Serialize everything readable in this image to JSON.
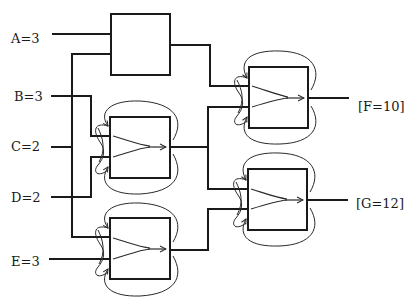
{
  "diagram": {
    "inputs": [
      {
        "id": "A",
        "label": "A=3"
      },
      {
        "id": "B",
        "label": "B=3"
      },
      {
        "id": "C",
        "label": "C=2"
      },
      {
        "id": "D",
        "label": "D=2"
      },
      {
        "id": "E",
        "label": "E=3"
      }
    ],
    "outputs": [
      {
        "id": "F",
        "label": "[F=10]"
      },
      {
        "id": "G",
        "label": "[G=12]"
      }
    ],
    "nodes": [
      {
        "id": "box-top",
        "kind": "plain-box",
        "inputs": [
          "A",
          "C-branch"
        ]
      },
      {
        "id": "box-mid",
        "kind": "merge-box",
        "inputs": [
          "B",
          "D"
        ]
      },
      {
        "id": "box-bottom",
        "kind": "merge-box",
        "inputs": [
          "C-branch",
          "E"
        ]
      },
      {
        "id": "box-right-top",
        "kind": "merge-box",
        "inputs": [
          "box-top",
          "box-mid"
        ],
        "output": "F"
      },
      {
        "id": "box-right-bottom",
        "kind": "merge-box",
        "inputs": [
          "box-mid",
          "box-bottom"
        ],
        "output": "G"
      }
    ]
  }
}
